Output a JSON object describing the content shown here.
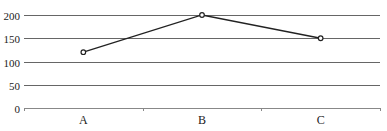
{
  "chart_data": {
    "type": "line",
    "title": "",
    "xlabel": "",
    "ylabel": "",
    "categories": [
      "A",
      "B",
      "C"
    ],
    "series": [
      {
        "name": "",
        "values": [
          120,
          200,
          150
        ]
      }
    ],
    "ylim": [
      0,
      200
    ],
    "yticks": [
      0,
      50,
      100,
      150,
      200
    ],
    "grid": true,
    "legend": null,
    "colors": {
      "line": "#222222",
      "grid": "#666666",
      "axis": "#888888",
      "marker_fill": "#ffffff"
    }
  }
}
